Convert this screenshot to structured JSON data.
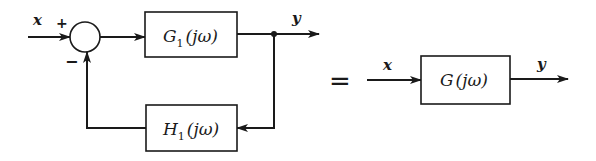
{
  "diagram": {
    "type": "block-diagram",
    "left": {
      "input_label": "x",
      "output_label": "y",
      "summing_junction": {
        "plus_sign": "+",
        "minus_sign": "−"
      },
      "forward_block": {
        "name": "G",
        "subscript": "1",
        "arg": "(jω)"
      },
      "feedback_block": {
        "name": "H",
        "subscript": "1",
        "arg": "(jω)"
      }
    },
    "equals": "=",
    "right": {
      "input_label": "x",
      "output_label": "y",
      "block": {
        "name": "G",
        "arg": "(jω)"
      }
    },
    "colors": {
      "ink": "#1a1a1a",
      "background": "#ffffff"
    }
  }
}
